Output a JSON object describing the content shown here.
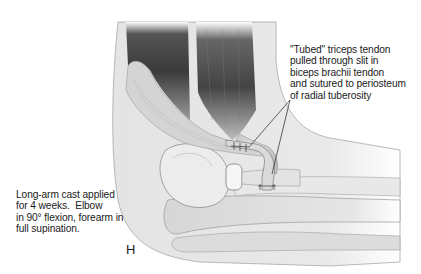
{
  "figure": {
    "panel_letter": "H",
    "annotations": {
      "tendon_transfer": "\"Tubed\" triceps tendon\npulled through slit in\nbiceps brachii tendon\nand sutured to periosteum\nof radial tuberosity",
      "postop_cast": "Long-arm cast applied\nfor 4 weeks.  Elbow\nin 90° flexion, forearm in\nfull supination."
    },
    "colors": {
      "background": "#ffffff",
      "text": "#1a1a1a",
      "muscle_dark": "#3a3a3a",
      "tendon_light": "#d8d8d8",
      "skin": "#e6e6e6",
      "bone": "#f2f2f2",
      "outline": "#8a8a8a"
    }
  }
}
